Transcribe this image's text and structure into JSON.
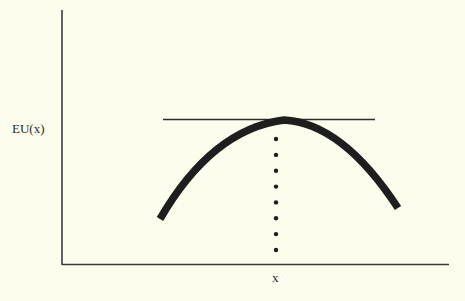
{
  "figure": {
    "title": "",
    "y_axis_label": "EU(x)",
    "x_axis_label": "x",
    "background_color": "#fdfdee",
    "ink_color": "#1e1e1e"
  },
  "diagram": {
    "type": "concave-curve-with-tangent",
    "curve": {
      "name": "EU(x)",
      "shape": "inverted-parabola",
      "description": "Thick concave expected-utility curve reaching a single maximum"
    },
    "tangent_line": {
      "description": "Horizontal line tangent to the curve at its maximum"
    },
    "dotted_drop_line": {
      "description": "Vertical dotted line from the maximum down to the x-axis",
      "dot_count": 8
    }
  }
}
